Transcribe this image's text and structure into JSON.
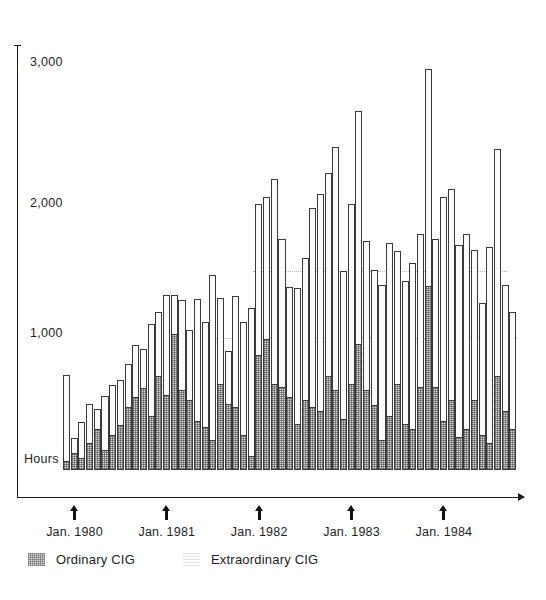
{
  "chart_data": {
    "type": "bar",
    "subtype": "stacked-bar",
    "title": "",
    "xlabel": "",
    "ylabel": "Hours",
    "ylim": [
      0,
      3200
    ],
    "yticks": [
      1000,
      2000,
      3000
    ],
    "ytick_labels": [
      "1,000",
      "2,000",
      "3,000"
    ],
    "grid": "horizontal-dotted-partial",
    "legend_position": "below-axis-left",
    "series": [
      {
        "name": "Ordinary CIG",
        "fill": "stippled-gray",
        "values": [
          60,
          120,
          80,
          200,
          300,
          140,
          260,
          330,
          470,
          540,
          610,
          400,
          700,
          560,
          1020,
          600,
          520,
          360,
          320,
          220,
          640,
          490,
          470,
          260,
          100,
          860,
          980,
          640,
          620,
          540,
          340,
          520,
          470,
          440,
          700,
          600,
          380,
          640,
          940,
          600,
          480,
          220,
          400,
          640,
          340,
          300,
          620,
          1380,
          620,
          360,
          520,
          240,
          300,
          520,
          260,
          200,
          700,
          440,
          300
        ]
      },
      {
        "name": "Extraordinary CIG",
        "fill": "white-outline",
        "values": [
          660,
          120,
          280,
          300,
          160,
          420,
          380,
          350,
          330,
          400,
          300,
          700,
          490,
          760,
          300,
          680,
          540,
          930,
          800,
          1250,
          660,
          410,
          840,
          860,
          1120,
          1150,
          1080,
          1560,
          1120,
          840,
          1030,
          1080,
          1510,
          1640,
          1540,
          1840,
          1120,
          1370,
          1770,
          1130,
          1030,
          1180,
          1310,
          1010,
          1090,
          1260,
          1160,
          1650,
          1120,
          1700,
          1600,
          1460,
          1480,
          1140,
          1000,
          1480,
          1720,
          960,
          890
        ]
      }
    ],
    "x_markers": [
      {
        "label": "Jan. 1980",
        "bar_index": 1
      },
      {
        "label": "Jan. 1981",
        "bar_index": 13
      },
      {
        "label": "Jan. 1982",
        "bar_index": 25
      },
      {
        "label": "Jan. 1983",
        "bar_index": 37
      },
      {
        "label": "Jan. 1984",
        "bar_index": 49
      }
    ],
    "colors": {
      "ordinary_fill": "#d9d9d9",
      "extraordinary_fill": "#fbfbfb",
      "outline": "#3a3a3a",
      "axis": "#1d1d1d",
      "gridline": "#b9b9b9",
      "text": "#1e1e1e"
    }
  },
  "axis": {
    "y_label": "Hours",
    "ticks": [
      "3,000",
      "2,000",
      "1,000"
    ]
  },
  "legend": {
    "items": [
      {
        "label": "Ordinary CIG",
        "swatch": "stipple-swatch-icon"
      },
      {
        "label": "Extraordinary CIG",
        "swatch": "light-swatch-icon"
      }
    ]
  }
}
